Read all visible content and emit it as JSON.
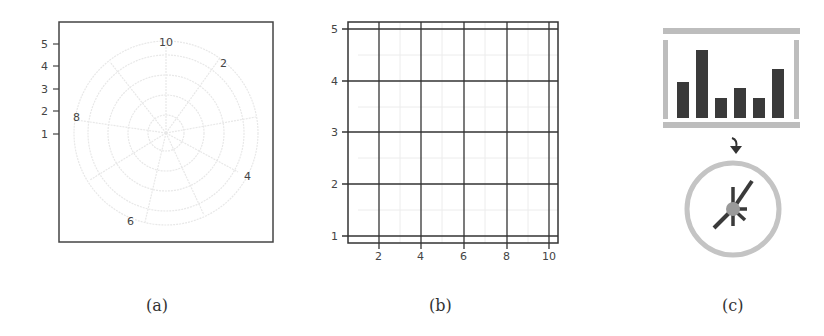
{
  "panels": [
    {
      "id": "a",
      "caption": "(a)",
      "type": "polar-grid",
      "y_ticks": [
        "5",
        "4",
        "3",
        "2",
        "1"
      ],
      "angular_labels": [
        "10",
        "2",
        "4",
        "6",
        "8"
      ]
    },
    {
      "id": "b",
      "caption": "(b)",
      "type": "cartesian-grid",
      "y_ticks": [
        "5",
        "4",
        "3",
        "2",
        "1"
      ],
      "x_ticks": [
        "2",
        "4",
        "6",
        "8",
        "10"
      ]
    },
    {
      "id": "c",
      "caption": "(c)",
      "type": "icon-transform",
      "bar_heights_relative": [
        0.41,
        0.83,
        0.23,
        0.36,
        0.23,
        0.62
      ],
      "arrow": "down"
    }
  ],
  "colors": {
    "frame": "#333333",
    "grid_light": "#e6e6e6",
    "icon_gray": "#bdbdbd",
    "bar_dark": "#3a3a3a",
    "hub": "#9a9a9a"
  }
}
